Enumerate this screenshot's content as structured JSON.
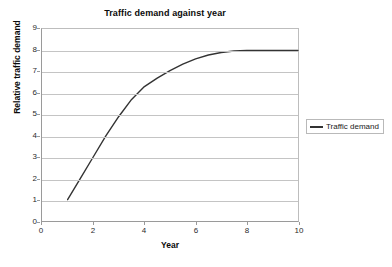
{
  "chart_data": {
    "type": "line",
    "title": "Traffic demand against year",
    "xlabel": "Year",
    "ylabel": "Relative traffic demand",
    "xlim": [
      0,
      10
    ],
    "ylim": [
      0,
      9
    ],
    "xticks": [
      0,
      2,
      4,
      6,
      8,
      10
    ],
    "yticks": [
      0,
      1,
      2,
      3,
      4,
      5,
      6,
      7,
      8,
      9
    ],
    "grid": "horizontal",
    "legend_position": "right",
    "series": [
      {
        "name": "Traffic demand",
        "color": "#333333",
        "x": [
          1,
          1.5,
          2,
          2.5,
          3,
          3.5,
          4,
          4.5,
          5,
          5.5,
          6,
          6.5,
          7,
          7.5,
          8,
          8.5,
          9,
          9.5,
          10
        ],
        "values": [
          1,
          2.0,
          3.0,
          4.0,
          4.9,
          5.7,
          6.3,
          6.7,
          7.05,
          7.35,
          7.6,
          7.78,
          7.9,
          7.97,
          8.0,
          8.0,
          8.0,
          8.0,
          8.0
        ]
      }
    ]
  },
  "legend": {
    "entries": [
      {
        "label": "Traffic demand",
        "swatch": "line-swatch"
      }
    ]
  }
}
